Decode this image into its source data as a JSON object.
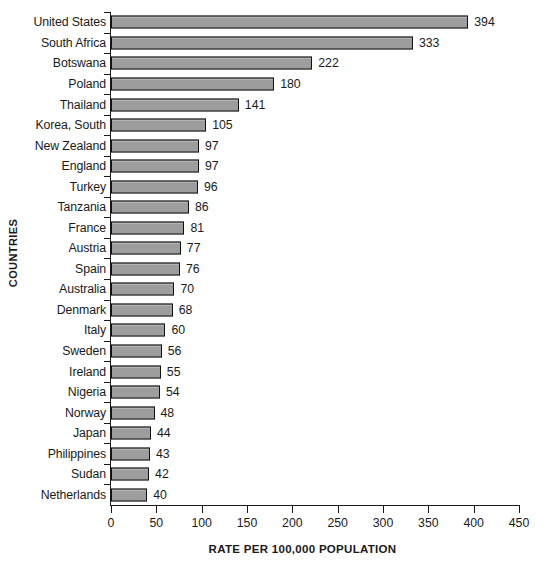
{
  "chart_data": {
    "type": "bar",
    "orientation": "horizontal",
    "title": "",
    "xlabel": "RATE PER 100,000 POPULATION",
    "ylabel": "COUNTRIES",
    "xlim": [
      0,
      450
    ],
    "xticks": [
      0,
      50,
      100,
      150,
      200,
      250,
      300,
      350,
      400,
      450
    ],
    "grid": false,
    "legend": false,
    "bar_color": "#9d9d9d",
    "bar_edge_color": "#111111",
    "categories": [
      "United States",
      "South Africa",
      "Botswana",
      "Poland",
      "Thailand",
      "Korea, South",
      "New Zealand",
      "England",
      "Turkey",
      "Tanzania",
      "France",
      "Austria",
      "Spain",
      "Australia",
      "Denmark",
      "Italy",
      "Sweden",
      "Ireland",
      "Nigeria",
      "Norway",
      "Japan",
      "Philippines",
      "Sudan",
      "Netherlands"
    ],
    "values": [
      394,
      333,
      222,
      180,
      141,
      105,
      97,
      97,
      96,
      86,
      81,
      77,
      76,
      70,
      68,
      60,
      56,
      55,
      54,
      48,
      44,
      43,
      42,
      40
    ]
  }
}
